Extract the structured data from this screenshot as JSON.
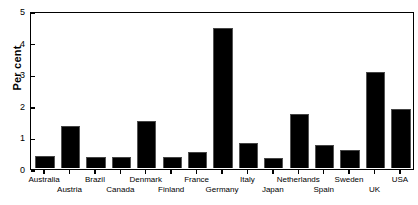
{
  "chart_data": {
    "type": "bar",
    "title": "",
    "xlabel": "",
    "ylabel": "Per cent",
    "ylim": [
      0,
      5
    ],
    "yticks": [
      0,
      1,
      2,
      3,
      4,
      5
    ],
    "ytick_labels": [
      "0",
      "1",
      "2",
      "3",
      "4",
      "5"
    ],
    "grid": false,
    "legend": "none",
    "bar_color": "#000000",
    "categories": [
      "Australia",
      "Austria",
      "Brazil",
      "Canada",
      "Denmark",
      "Finland",
      "France",
      "Germany",
      "Italy",
      "Japan",
      "Netherlands",
      "Spain",
      "Sweden",
      "UK",
      "USA"
    ],
    "values": [
      0.36,
      1.33,
      0.33,
      0.35,
      1.5,
      0.35,
      0.5,
      4.45,
      0.78,
      0.32,
      1.72,
      0.73,
      0.57,
      3.05,
      1.88
    ],
    "label_rows": [
      0,
      1,
      0,
      1,
      0,
      1,
      0,
      1,
      0,
      1,
      0,
      1,
      0,
      1,
      0
    ]
  },
  "caption": ""
}
